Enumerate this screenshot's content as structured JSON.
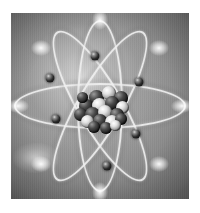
{
  "image": {
    "title": "Atom model illustration",
    "subject": "atom",
    "style": "grayscale airbrush rendering",
    "background_color": "#8d8d8d",
    "plate": {
      "x": 11,
      "y": 13,
      "width": 178,
      "height": 186
    },
    "margin_color": "#ffffff"
  },
  "nucleus": {
    "label": "nucleus",
    "center": {
      "x": 50,
      "y": 50
    },
    "width_px": 58,
    "height_px": 52,
    "nucleon_count": 19,
    "dark_color": "#141414",
    "light_color": "#e8e8e8",
    "nucleons": [
      {
        "x": 18,
        "y": 10,
        "d": 15,
        "tone": "dark"
      },
      {
        "x": 31,
        "y": 6,
        "d": 14,
        "tone": "light"
      },
      {
        "x": 43,
        "y": 11,
        "d": 14,
        "tone": "dark"
      },
      {
        "x": 8,
        "y": 19,
        "d": 14,
        "tone": "dark"
      },
      {
        "x": 21,
        "y": 18,
        "d": 15,
        "tone": "light"
      },
      {
        "x": 34,
        "y": 16,
        "d": 14,
        "tone": "dark"
      },
      {
        "x": 45,
        "y": 21,
        "d": 13,
        "tone": "light"
      },
      {
        "x": 3,
        "y": 28,
        "d": 13,
        "tone": "dark"
      },
      {
        "x": 14,
        "y": 27,
        "d": 15,
        "tone": "dark"
      },
      {
        "x": 27,
        "y": 25,
        "d": 14,
        "tone": "light"
      },
      {
        "x": 39,
        "y": 28,
        "d": 14,
        "tone": "dark"
      },
      {
        "x": 10,
        "y": 35,
        "d": 13,
        "tone": "light"
      },
      {
        "x": 22,
        "y": 34,
        "d": 14,
        "tone": "dark"
      },
      {
        "x": 34,
        "y": 35,
        "d": 14,
        "tone": "light"
      },
      {
        "x": 44,
        "y": 33,
        "d": 12,
        "tone": "dark"
      },
      {
        "x": 17,
        "y": 41,
        "d": 12,
        "tone": "dark"
      },
      {
        "x": 29,
        "y": 42,
        "d": 12,
        "tone": "dark"
      },
      {
        "x": 39,
        "y": 40,
        "d": 11,
        "tone": "light"
      },
      {
        "x": 6,
        "y": 12,
        "d": 11,
        "tone": "dark"
      }
    ]
  },
  "orbits": {
    "label": "electron orbits",
    "count": 4,
    "stroke_color": "#efefef",
    "items": [
      {
        "name": "horizontal-orbit",
        "rx": 86,
        "ry": 23,
        "rotation_deg": 0,
        "thickness": 2.4
      },
      {
        "name": "vertical-orbit",
        "rx": 23,
        "ry": 86,
        "rotation_deg": 0,
        "thickness": 2.4
      },
      {
        "name": "diagonal-orbit-1",
        "rx": 86,
        "ry": 23,
        "rotation_deg": 60,
        "thickness": 2.4
      },
      {
        "name": "diagonal-orbit-2",
        "rx": 86,
        "ry": 23,
        "rotation_deg": 120,
        "thickness": 2.4
      }
    ]
  },
  "electrons": {
    "label": "electrons",
    "count": 6,
    "color": "#0d0d0d",
    "diameter_px": 9,
    "items": [
      {
        "name": "electron-top",
        "x": 47,
        "y": 23
      },
      {
        "name": "electron-upper-right",
        "x": 72,
        "y": 37
      },
      {
        "name": "electron-lower-right",
        "x": 70,
        "y": 65
      },
      {
        "name": "electron-bottom",
        "x": 54,
        "y": 82
      },
      {
        "name": "electron-left",
        "x": 25,
        "y": 57
      },
      {
        "name": "electron-upper-left",
        "x": 22,
        "y": 35
      }
    ]
  },
  "highlights": {
    "label": "specular orbit tips",
    "items": [
      {
        "name": "tip-top",
        "x": 50,
        "y": 4,
        "w": 16,
        "h": 20
      },
      {
        "name": "tip-bottom",
        "x": 50,
        "y": 96,
        "w": 16,
        "h": 20
      },
      {
        "name": "tip-left",
        "x": 4,
        "y": 50,
        "w": 22,
        "h": 14
      },
      {
        "name": "tip-right",
        "x": 96,
        "y": 50,
        "w": 22,
        "h": 14
      },
      {
        "name": "tip-upper-left",
        "x": 17,
        "y": 19,
        "w": 20,
        "h": 16
      },
      {
        "name": "tip-upper-right",
        "x": 83,
        "y": 19,
        "w": 20,
        "h": 16
      },
      {
        "name": "tip-lower-left",
        "x": 17,
        "y": 81,
        "w": 20,
        "h": 16
      },
      {
        "name": "tip-lower-right",
        "x": 83,
        "y": 81,
        "w": 20,
        "h": 16
      }
    ]
  }
}
